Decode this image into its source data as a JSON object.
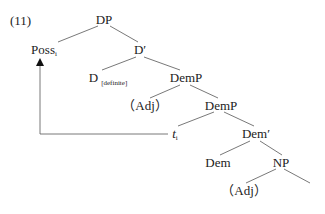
{
  "example_number": "(11)",
  "tree": {
    "nodes": {
      "dp": {
        "label": "DP"
      },
      "poss": {
        "label": "Poss",
        "subscript": "i"
      },
      "d_bar": {
        "label": "D′"
      },
      "d": {
        "label": "D",
        "feature": "[definite]"
      },
      "demp1": {
        "label": "DemP"
      },
      "adj1": {
        "label": "（Adj）"
      },
      "demp2": {
        "label": "DemP"
      },
      "trace": {
        "label": "t",
        "subscript": "i"
      },
      "dem_bar": {
        "label": "Dem′"
      },
      "dem": {
        "label": "Dem"
      },
      "np": {
        "label": "NP"
      },
      "adj2": {
        "label": "（Adj）"
      }
    },
    "edges": [
      [
        "DP",
        "Poss_i"
      ],
      [
        "DP",
        "D′"
      ],
      [
        "D′",
        "D[definite]"
      ],
      [
        "D′",
        "DemP"
      ],
      [
        "DemP",
        "(Adj)"
      ],
      [
        "DemP",
        "DemP"
      ],
      [
        "DemP",
        "t_i"
      ],
      [
        "DemP",
        "Dem′"
      ],
      [
        "Dem′",
        "Dem"
      ],
      [
        "Dem′",
        "NP"
      ],
      [
        "NP",
        "(Adj)"
      ],
      [
        "NP",
        ""
      ]
    ],
    "movement_arrow": {
      "from": "t_i",
      "to": "Poss_i"
    }
  }
}
